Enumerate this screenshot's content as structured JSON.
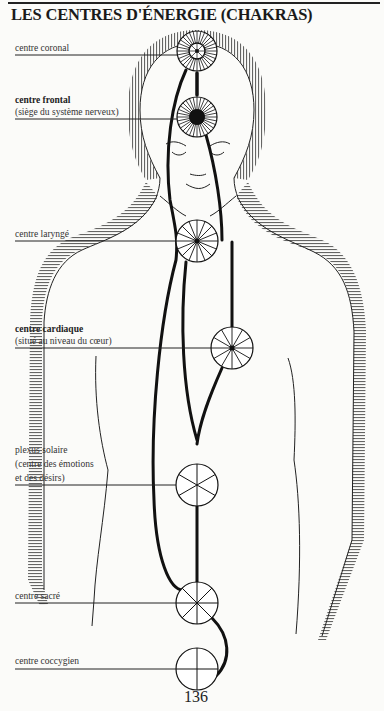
{
  "page": {
    "title": "LES CENTRES D'ÉNERGIE  (CHAKRAS)",
    "page_number": "136"
  },
  "chakras": [
    {
      "id": "coronal",
      "title": "centre coronal",
      "bold": false,
      "subtitle": ""
    },
    {
      "id": "frontal",
      "title": "centre frontal",
      "bold": true,
      "subtitle": "(siège du système nerveux)"
    },
    {
      "id": "larynge",
      "title": "centre laryngé",
      "bold": false,
      "subtitle": ""
    },
    {
      "id": "cardiaque",
      "title": "centre cardiaque",
      "bold": true,
      "subtitle": "(situé au niveau du cœur)"
    },
    {
      "id": "plexus",
      "title": "plexus solaire",
      "bold": false,
      "subtitle": "(centre des émotions",
      "subtitle2": "et des désirs)"
    },
    {
      "id": "sacre",
      "title": "centre sacré",
      "bold": false,
      "subtitle": ""
    },
    {
      "id": "coccygien",
      "title": "centre coccygien",
      "bold": false,
      "subtitle": ""
    }
  ],
  "colors": {
    "ink": "#1a1a1a",
    "paper": "#fbfbf9"
  }
}
